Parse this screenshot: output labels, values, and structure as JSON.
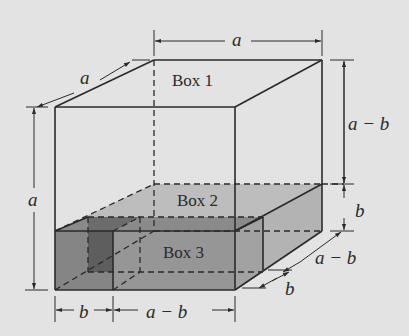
{
  "diagram": {
    "type": "3d-box-decomposition",
    "colors": {
      "background": "#e3e3e3",
      "line": "#2a2a2a",
      "box1_fill": "#e3e3e3",
      "box2_fill": "#bdbdbd",
      "box3_front_fill": "#8f8f8f",
      "box3_side_fill": "#a4a4a4",
      "box3_dark_strip": "#6a6a6a"
    },
    "boxes": [
      {
        "id": "box1",
        "label": "Box 1",
        "dimensions": "a × a × (a − b)"
      },
      {
        "id": "box2",
        "label": "Box 2",
        "dimensions": "a × (a − b) × b"
      },
      {
        "id": "box3",
        "label": "Box 3",
        "dimensions": "a × b × b"
      }
    ],
    "dimensions": {
      "top_width": "a",
      "front_depth": "a",
      "left_height": "a",
      "right_upper_height": "a − b",
      "right_lower_height": "b",
      "depth_far": "a − b",
      "depth_near": "b",
      "bottom_left": "b",
      "bottom_right": "a − b"
    }
  }
}
